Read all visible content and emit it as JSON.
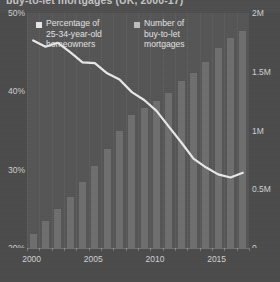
{
  "title": "buy-to-let mortgages (UK, 2000-17)",
  "legend": {
    "bars": {
      "swatch_name": "legend-swatch-bars",
      "lines": [
        "Percentage of",
        "25-34-year-old",
        "homeowners"
      ]
    },
    "line": {
      "swatch_name": "legend-swatch-line",
      "lines": [
        "Number of",
        "buy-to-let",
        "mortgages"
      ]
    }
  },
  "axes": {
    "left": {
      "label": "",
      "ticks": [
        "50%",
        "40%",
        "30%",
        "20%"
      ],
      "values": [
        50,
        40,
        30,
        20
      ],
      "min": 20,
      "max": 50
    },
    "right": {
      "label": "",
      "ticks": [
        "2M",
        "1.5M",
        "1M",
        "0.5M",
        "0"
      ],
      "values": [
        2000000,
        1500000,
        1000000,
        500000,
        0
      ],
      "min": 0,
      "max": 2000000
    },
    "x": {
      "ticks": [
        "2000",
        "2005",
        "2010",
        "2015"
      ],
      "values": [
        2000,
        2005,
        2010,
        2015
      ],
      "min": 2000,
      "max": 2017
    }
  },
  "colors": {
    "background": "#4b4b4b",
    "plot_background": "#555555",
    "bar": "#6e6e6e",
    "line": "#e8e8e8",
    "text": "#d6d6d6"
  },
  "chart_data": {
    "type": "bar",
    "title": "buy-to-let mortgages (UK, 2000-17)",
    "xlabel": "",
    "ylabel": "",
    "grid": false,
    "legend_position": "top-left",
    "x": [
      2000,
      2001,
      2002,
      2003,
      2004,
      2005,
      2006,
      2007,
      2008,
      2009,
      2010,
      2011,
      2012,
      2013,
      2014,
      2015,
      2016,
      2017
    ],
    "categories": [
      "2000",
      "2001",
      "2002",
      "2003",
      "2004",
      "2005",
      "2006",
      "2007",
      "2008",
      "2009",
      "2010",
      "2011",
      "2012",
      "2013",
      "2014",
      "2015",
      "2016",
      "2017"
    ],
    "series": [
      {
        "name": "Number of buy-to-let mortgages",
        "type": "bar",
        "axis": "right",
        "unit": "mortgages",
        "ylim": [
          0,
          2000000
        ],
        "values": [
          120000,
          230000,
          330000,
          430000,
          560000,
          700000,
          840000,
          1000000,
          1130000,
          1190000,
          1250000,
          1320000,
          1420000,
          1490000,
          1580000,
          1700000,
          1790000,
          1850000
        ]
      },
      {
        "name": "Percentage of 25-34-year-old homeowners",
        "type": "line",
        "axis": "left",
        "unit": "%",
        "ylim": [
          20,
          50
        ],
        "values": [
          46.5,
          45.7,
          46.2,
          45.0,
          43.7,
          43.6,
          42.3,
          41.5,
          39.9,
          38.9,
          37.5,
          35.5,
          33.5,
          31.4,
          30.3,
          29.4,
          29.0,
          29.6
        ]
      }
    ]
  }
}
